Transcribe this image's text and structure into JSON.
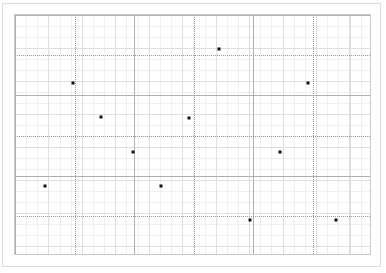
{
  "figure": {
    "title": "",
    "background_color": "#ffffff",
    "frame_color": "#dcdcdc"
  },
  "plot": {
    "marker_color": "#111111",
    "grid_minor_color": "#efefef",
    "grid_mid_color": "#dedede",
    "grid_major_color": "#b0b0b0",
    "axis_color": "#c8c8c8"
  },
  "chart_data": {
    "type": "scatter",
    "title": "",
    "xlabel": "",
    "ylabel": "",
    "xlim": [
      0,
      12
    ],
    "ylim": [
      0,
      12
    ],
    "grid": true,
    "legend": "none",
    "xticks": [
      0,
      2,
      4,
      6,
      8,
      10,
      12
    ],
    "yticks": [
      0,
      2,
      4,
      6,
      8,
      10,
      12
    ],
    "xticklabels": [],
    "yticklabels": [],
    "marker": "square",
    "marker_size": 3,
    "series": [
      {
        "name": "points",
        "color": "#111111",
        "points": [
          {
            "x": 1.0,
            "y": 3.5
          },
          {
            "x": 1.95,
            "y": 8.6
          },
          {
            "x": 2.9,
            "y": 6.9
          },
          {
            "x": 3.95,
            "y": 5.2
          },
          {
            "x": 4.9,
            "y": 3.5
          },
          {
            "x": 5.85,
            "y": 6.85
          },
          {
            "x": 6.85,
            "y": 10.3
          },
          {
            "x": 7.9,
            "y": 1.8
          },
          {
            "x": 8.9,
            "y": 5.2
          },
          {
            "x": 9.85,
            "y": 8.6
          },
          {
            "x": 10.8,
            "y": 1.8
          }
        ]
      }
    ]
  }
}
